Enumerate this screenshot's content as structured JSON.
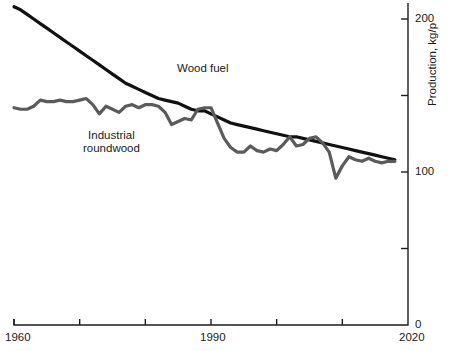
{
  "chart_data": {
    "type": "line",
    "title": "",
    "xlabel": "",
    "ylabel": "Production, kg/p",
    "xlim": [
      1960,
      2020
    ],
    "ylim": [
      0,
      220
    ],
    "xticks": [
      1960,
      1970,
      1980,
      1990,
      2000,
      2010,
      2020
    ],
    "xtick_labels": [
      "1960",
      "",
      "",
      "1990",
      "",
      "",
      "2020"
    ],
    "yticks": [
      0,
      50,
      100,
      150,
      200
    ],
    "ytick_labels": [
      "0",
      "",
      "100",
      "",
      "200"
    ],
    "grid": false,
    "legend_position": "inline-annotations",
    "axis_position": {
      "y_axis": "right",
      "x_axis": "bottom"
    },
    "annotations": [
      {
        "text": "Wood fuel",
        "x": 1985,
        "y": 152
      },
      {
        "text": "Industrial roundwood",
        "x": 1972,
        "y": 118
      }
    ],
    "series": [
      {
        "name": "Wood fuel",
        "color": "#111111",
        "x": [
          1960,
          1961,
          1962,
          1963,
          1964,
          1965,
          1966,
          1967,
          1968,
          1969,
          1970,
          1971,
          1972,
          1973,
          1974,
          1975,
          1976,
          1977,
          1978,
          1979,
          1980,
          1981,
          1982,
          1983,
          1984,
          1985,
          1986,
          1987,
          1988,
          1989,
          1990,
          1991,
          1992,
          1993,
          1994,
          1995,
          1996,
          1997,
          1998,
          1999,
          2000,
          2001,
          2002,
          2003,
          2004,
          2005,
          2006,
          2007,
          2008,
          2009,
          2010,
          2011,
          2012,
          2013,
          2014,
          2015,
          2016,
          2017,
          2018
        ],
        "values": [
          208,
          206,
          203,
          200,
          197,
          194,
          191,
          188,
          185,
          182,
          179,
          176,
          173,
          170,
          167,
          164,
          161,
          158,
          156,
          154,
          152,
          150,
          148,
          147,
          146,
          145,
          143,
          141,
          140,
          140,
          138,
          136,
          134,
          132,
          131,
          130,
          129,
          128,
          127,
          126,
          125,
          124,
          123,
          123,
          122,
          121,
          120,
          119,
          118,
          117,
          116,
          115,
          114,
          113,
          112,
          111,
          110,
          109,
          108
        ]
      },
      {
        "name": "Industrial roundwood",
        "color": "#5b5b5b",
        "x": [
          1960,
          1961,
          1962,
          1963,
          1964,
          1965,
          1966,
          1967,
          1968,
          1969,
          1970,
          1971,
          1972,
          1973,
          1974,
          1975,
          1976,
          1977,
          1978,
          1979,
          1980,
          1981,
          1982,
          1983,
          1984,
          1985,
          1986,
          1987,
          1988,
          1989,
          1990,
          1991,
          1992,
          1993,
          1994,
          1995,
          1996,
          1997,
          1998,
          1999,
          2000,
          2001,
          2002,
          2003,
          2004,
          2005,
          2006,
          2007,
          2008,
          2009,
          2010,
          2011,
          2012,
          2013,
          2014,
          2015,
          2016,
          2017,
          2018
        ],
        "values": [
          142,
          141,
          141,
          143,
          147,
          146,
          146,
          147,
          146,
          146,
          147,
          148,
          144,
          138,
          143,
          141,
          139,
          143,
          144,
          142,
          144,
          144,
          143,
          139,
          131,
          133,
          135,
          134,
          141,
          142,
          142,
          132,
          122,
          116,
          113,
          113,
          117,
          114,
          113,
          115,
          114,
          118,
          123,
          117,
          118,
          122,
          123,
          119,
          113,
          96,
          104,
          110,
          108,
          107,
          109,
          107,
          106,
          107,
          107
        ]
      }
    ]
  },
  "labels": {
    "wood_fuel": "Wood fuel",
    "industrial_roundwood_line1": "Industrial",
    "industrial_roundwood_line2": "roundwood",
    "y_axis_title": "Production, kg/p",
    "x_1960": "1960",
    "x_1990": "1990",
    "x_2020": "2020",
    "y_0": "0",
    "y_100": "100",
    "y_200": "200"
  },
  "colors": {
    "wood_fuel": "#111111",
    "industrial_roundwood": "#5b5b5b",
    "axis": "#1d1d1d",
    "background": "#ffffff"
  }
}
